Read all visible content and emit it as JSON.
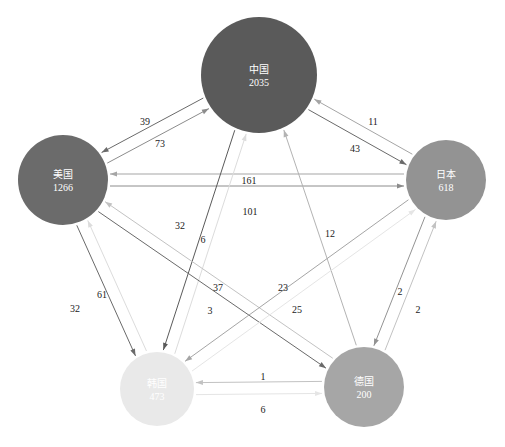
{
  "diagram": {
    "type": "directed-flow-network",
    "nodes": [
      {
        "id": "china",
        "label": "中国",
        "value": "2035",
        "x": 259,
        "y": 75,
        "r": 58,
        "color": "#5a5a5a"
      },
      {
        "id": "usa",
        "label": "美国",
        "value": "1266",
        "x": 63,
        "y": 180,
        "r": 45,
        "color": "#6b6b6b"
      },
      {
        "id": "japan",
        "label": "日本",
        "value": "618",
        "x": 446,
        "y": 180,
        "r": 40,
        "color": "#939393"
      },
      {
        "id": "korea",
        "label": "韩国",
        "value": "473",
        "x": 157,
        "y": 389,
        "r": 37,
        "color": "#e9e9e9"
      },
      {
        "id": "germany",
        "label": "德国",
        "value": "200",
        "x": 364,
        "y": 387,
        "r": 40,
        "color": "#a6a6a6"
      }
    ],
    "edges": [
      {
        "from": "china",
        "to": "usa",
        "value": "39",
        "color": "#6a6a6a",
        "label_x": 145,
        "label_y": 125
      },
      {
        "from": "usa",
        "to": "china",
        "value": "73",
        "color": "#8c8c8c",
        "label_x": 160,
        "label_y": 147
      },
      {
        "from": "china",
        "to": "japan",
        "value": "11",
        "color": "#6a6a6a",
        "label_x": 373,
        "label_y": 125
      },
      {
        "from": "japan",
        "to": "china",
        "value": "43",
        "color": "#a5a5a5",
        "label_x": 355,
        "label_y": 152
      },
      {
        "from": "usa",
        "to": "japan",
        "value": "161",
        "color": "#8c8c8c",
        "label_x": 249,
        "label_y": 184
      },
      {
        "from": "japan",
        "to": "usa",
        "value": "101",
        "color": "#a5a5a5",
        "label_x": 250,
        "label_y": 215
      },
      {
        "from": "korea",
        "to": "china",
        "value": "32",
        "color": "#dcdcdc",
        "label_x": 180,
        "label_y": 229
      },
      {
        "from": "china",
        "to": "korea",
        "value": "6",
        "color": "#5a5a5a",
        "label_x": 203,
        "label_y": 243
      },
      {
        "from": "germany",
        "to": "china",
        "value": "12",
        "color": "#b3b3b3",
        "label_x": 330,
        "label_y": 237
      },
      {
        "from": "usa",
        "to": "germany",
        "value": "37",
        "color": "#6a6a6a",
        "label_x": 218,
        "label_y": 291
      },
      {
        "from": "germany",
        "to": "usa",
        "value": "3",
        "color": "#c2c2c2",
        "label_x": 210,
        "label_y": 314
      },
      {
        "from": "japan",
        "to": "korea",
        "value": "23",
        "color": "#a5a5a5",
        "label_x": 283,
        "label_y": 291
      },
      {
        "from": "korea",
        "to": "japan",
        "value": "25",
        "color": "#e5e5e5",
        "label_x": 297,
        "label_y": 313
      },
      {
        "from": "usa",
        "to": "korea",
        "value": "32",
        "color": "#6a6a6a",
        "label_x": 75,
        "label_y": 312
      },
      {
        "from": "korea",
        "to": "usa",
        "value": "61",
        "color": "#dcdcdc",
        "label_x": 102,
        "label_y": 298
      },
      {
        "from": "japan",
        "to": "germany",
        "value": "2",
        "color": "#939393",
        "label_x": 400,
        "label_y": 295
      },
      {
        "from": "germany",
        "to": "japan",
        "value": "2",
        "color": "#c2c2c2",
        "label_x": 418,
        "label_y": 313
      },
      {
        "from": "korea",
        "to": "germany",
        "value": "1",
        "color": "#e5e5e5",
        "label_x": 263,
        "label_y": 380
      },
      {
        "from": "germany",
        "to": "korea",
        "value": "6",
        "color": "#c2c2c2",
        "label_x": 263,
        "label_y": 413
      }
    ]
  }
}
